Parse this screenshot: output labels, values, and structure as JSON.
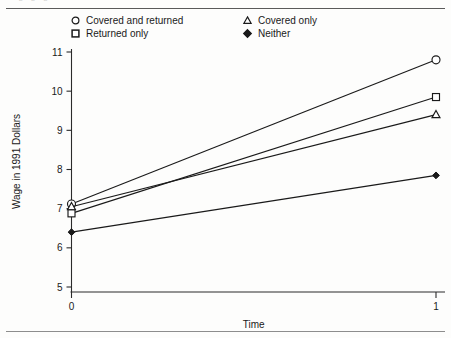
{
  "figure": {
    "clipped_header_text": "a                    g                              g                        g",
    "background_color": "#fdfdfc",
    "ink_color": "#1a1a1a"
  },
  "legend": {
    "position": "top",
    "columns": 2,
    "entries": [
      {
        "label": "Covered and returned",
        "marker": "circle-marker",
        "column": 1,
        "row": 1
      },
      {
        "label": "Covered only",
        "marker": "triangle-marker",
        "column": 2,
        "row": 1
      },
      {
        "label": "Returned only",
        "marker": "square-marker",
        "column": 1,
        "row": 2
      },
      {
        "label": "Neither",
        "marker": "diamond-marker",
        "column": 2,
        "row": 2
      }
    ]
  },
  "axes": {
    "y_title": "Wage in 1991 Dollars",
    "x_title": "Time",
    "y_ticks": [
      "11",
      "10",
      "9",
      "8",
      "7",
      "6",
      "5"
    ],
    "x_ticks": [
      "0",
      "1"
    ]
  },
  "chart_data": {
    "type": "line",
    "title": "",
    "subtitle": "",
    "xlabel": "Time",
    "ylabel": "Wage in 1991 Dollars",
    "x": [
      0,
      1
    ],
    "xlim": [
      0,
      1
    ],
    "ylim": [
      5,
      11
    ],
    "x_tick_values": [
      0,
      1
    ],
    "y_tick_values": [
      5,
      6,
      7,
      8,
      9,
      10,
      11
    ],
    "grid": false,
    "legend_position": "top",
    "series": [
      {
        "name": "Covered and returned",
        "marker": "circle",
        "values": [
          7.12,
          10.8
        ]
      },
      {
        "name": "Covered only",
        "marker": "triangle",
        "values": [
          7.05,
          9.4
        ]
      },
      {
        "name": "Returned only",
        "marker": "square",
        "values": [
          6.88,
          9.85
        ]
      },
      {
        "name": "Neither",
        "marker": "diamond",
        "values": [
          6.4,
          7.85
        ]
      }
    ]
  }
}
